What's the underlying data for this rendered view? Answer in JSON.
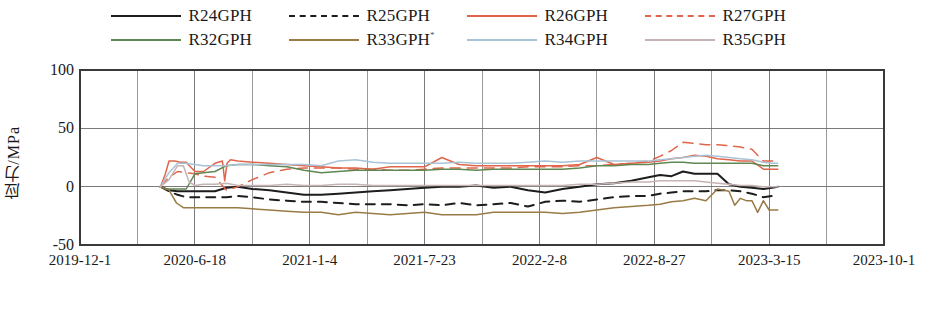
{
  "axes": {
    "ylabel": "应力/MPa",
    "xlabel": "日期",
    "yticks": [
      "100",
      "50",
      "0",
      "-50"
    ],
    "xticks": [
      "2019-12-1",
      "2020-6-18",
      "2021-1-4",
      "2021-7-23",
      "2022-2-8",
      "2022-8-27",
      "2023-3-15",
      "2023-10-1"
    ]
  },
  "legend": {
    "rows": [
      [
        {
          "label": "R24GPH",
          "color": "#1d1d1d",
          "dash": false,
          "star": ""
        },
        {
          "label": "R25GPH",
          "color": "#1d1d1d",
          "dash": true,
          "star": ""
        },
        {
          "label": "R26GPH",
          "color": "#e1654a",
          "dash": false,
          "star": ""
        },
        {
          "label": "R27GPH",
          "color": "#e1654a",
          "dash": true,
          "star": ""
        }
      ],
      [
        {
          "label": "R32GPH",
          "color": "#5f8752",
          "dash": false,
          "star": ""
        },
        {
          "label": "R33GPH",
          "color": "#9a7b46",
          "dash": false,
          "star": "*"
        },
        {
          "label": "R34GPH",
          "color": "#a9c3d6",
          "dash": false,
          "star": ""
        },
        {
          "label": "R35GPH",
          "color": "#c6b4b4",
          "dash": false,
          "star": ""
        }
      ]
    ]
  },
  "chart_data": {
    "type": "line",
    "title": "",
    "xlabel": "日期",
    "ylabel": "应力/MPa",
    "ylim": [
      -50,
      100
    ],
    "grid": true,
    "legend_position": "top",
    "x_tick_labels": [
      "2019-12-1",
      "2020-6-18",
      "2021-1-4",
      "2021-7-23",
      "2022-2-8",
      "2022-8-27",
      "2023-3-15",
      "2023-10-1"
    ],
    "x_tick_positions": [
      0,
      200,
      400,
      600,
      800,
      1000,
      1200,
      1400
    ],
    "x_units": "days since 2019-12-1",
    "x_data_range": [
      140,
      1215
    ],
    "series": [
      {
        "name": "R24GPH",
        "color": "#1d1d1d",
        "dash": "solid",
        "x": [
          140,
          155,
          170,
          185,
          200,
          215,
          235,
          255,
          275,
          300,
          330,
          360,
          390,
          420,
          450,
          480,
          510,
          540,
          570,
          600,
          630,
          660,
          690,
          720,
          750,
          780,
          810,
          840,
          870,
          900,
          930,
          960,
          990,
          1010,
          1030,
          1050,
          1070,
          1090,
          1110,
          1130,
          1150,
          1170,
          1190,
          1205,
          1215
        ],
        "y": [
          0,
          -3,
          -4,
          -4,
          -4,
          -4,
          -4,
          -1,
          0,
          -2,
          -3,
          -5,
          -7,
          -7,
          -6,
          -5,
          -4,
          -3,
          -2,
          -1,
          0,
          0,
          1,
          -1,
          0,
          -3,
          -5,
          -2,
          0,
          2,
          3,
          5,
          8,
          10,
          9,
          13,
          11,
          11,
          11,
          2,
          0,
          -1,
          -2,
          -1,
          0
        ]
      },
      {
        "name": "R25GPH",
        "color": "#1d1d1d",
        "dash": "dashed",
        "x": [
          140,
          155,
          170,
          185,
          200,
          215,
          235,
          255,
          275,
          300,
          330,
          360,
          390,
          420,
          450,
          480,
          510,
          540,
          570,
          600,
          630,
          660,
          690,
          720,
          750,
          780,
          810,
          840,
          870,
          900,
          930,
          960,
          990,
          1010,
          1030,
          1050,
          1070,
          1090,
          1110,
          1130,
          1150,
          1170,
          1190,
          1205,
          1215
        ],
        "y": [
          0,
          -4,
          -7,
          -9,
          -9,
          -9,
          -9,
          -9,
          -8,
          -9,
          -11,
          -12,
          -13,
          -13,
          -14,
          -15,
          -15,
          -15,
          -16,
          -15,
          -16,
          -14,
          -16,
          -15,
          -14,
          -17,
          -13,
          -12,
          -13,
          -11,
          -9,
          -8,
          -8,
          -6,
          -5,
          -4,
          -4,
          -4,
          -3,
          -3,
          -4,
          -6,
          -9,
          -8,
          -8
        ]
      },
      {
        "name": "R26GPH",
        "color": "#e1654a",
        "dash": "solid",
        "x": [
          140,
          148,
          155,
          165,
          175,
          185,
          200,
          215,
          235,
          248,
          252,
          256,
          262,
          275,
          300,
          330,
          360,
          390,
          420,
          450,
          480,
          510,
          540,
          570,
          600,
          630,
          660,
          690,
          720,
          750,
          780,
          810,
          840,
          870,
          900,
          930,
          960,
          990,
          1010,
          1030,
          1050,
          1070,
          1090,
          1110,
          1130,
          1150,
          1170,
          1190,
          1205,
          1215
        ],
        "y": [
          0,
          10,
          22,
          22,
          21,
          21,
          13,
          13,
          20,
          22,
          5,
          20,
          23,
          22,
          21,
          20,
          19,
          18,
          17,
          16,
          16,
          15,
          17,
          17,
          17,
          25,
          19,
          18,
          18,
          18,
          18,
          18,
          18,
          19,
          25,
          19,
          20,
          21,
          22,
          24,
          25,
          27,
          26,
          24,
          23,
          22,
          22,
          15,
          15,
          15
        ]
      },
      {
        "name": "R27GPH",
        "color": "#e1654a",
        "dash": "dashed",
        "x": [
          140,
          155,
          170,
          185,
          200,
          215,
          235,
          255,
          275,
          300,
          330,
          360,
          390,
          420,
          450,
          480,
          510,
          540,
          570,
          600,
          630,
          660,
          690,
          720,
          750,
          780,
          810,
          840,
          870,
          900,
          930,
          960,
          990,
          1010,
          1030,
          1050,
          1070,
          1090,
          1110,
          1130,
          1150,
          1170,
          1190,
          1205,
          1215
        ],
        "y": [
          0,
          8,
          13,
          12,
          11,
          9,
          8,
          -3,
          0,
          6,
          12,
          15,
          16,
          16,
          16,
          15,
          15,
          14,
          14,
          15,
          16,
          16,
          16,
          16,
          16,
          17,
          17,
          17,
          18,
          18,
          19,
          20,
          22,
          26,
          31,
          38,
          37,
          36,
          36,
          35,
          34,
          32,
          22,
          22,
          22
        ]
      },
      {
        "name": "R32GPH",
        "color": "#5f8752",
        "dash": "solid",
        "x": [
          140,
          150,
          160,
          170,
          185,
          200,
          215,
          235,
          255,
          275,
          300,
          330,
          360,
          390,
          420,
          450,
          480,
          510,
          540,
          570,
          600,
          630,
          660,
          690,
          720,
          750,
          780,
          810,
          840,
          870,
          900,
          930,
          960,
          990,
          1010,
          1030,
          1050,
          1070,
          1090,
          1110,
          1130,
          1150,
          1170,
          1190,
          1205,
          1215
        ],
        "y": [
          0,
          -2,
          -2,
          -2,
          -2,
          11,
          12,
          13,
          18,
          19,
          19,
          18,
          17,
          14,
          12,
          13,
          14,
          14,
          14,
          14,
          14,
          15,
          15,
          14,
          15,
          15,
          15,
          15,
          15,
          16,
          18,
          18,
          19,
          19,
          20,
          21,
          21,
          20,
          20,
          20,
          20,
          20,
          20,
          18,
          18,
          18
        ]
      },
      {
        "name": "R33GPH",
        "color": "#9a7b46",
        "dash": "solid",
        "x": [
          140,
          155,
          168,
          180,
          195,
          215,
          235,
          255,
          275,
          300,
          330,
          360,
          390,
          420,
          450,
          480,
          510,
          540,
          570,
          600,
          630,
          660,
          690,
          720,
          750,
          780,
          810,
          840,
          870,
          900,
          930,
          960,
          990,
          1010,
          1030,
          1050,
          1070,
          1090,
          1110,
          1130,
          1140,
          1150,
          1160,
          1170,
          1180,
          1190,
          1200,
          1215
        ],
        "y": [
          0,
          -3,
          -14,
          -18,
          -18,
          -18,
          -18,
          -18,
          -18,
          -19,
          -20,
          -21,
          -22,
          -22,
          -24,
          -22,
          -23,
          -24,
          -23,
          -22,
          -24,
          -24,
          -24,
          -22,
          -22,
          -22,
          -22,
          -23,
          -22,
          -20,
          -18,
          -17,
          -16,
          -15,
          -13,
          -12,
          -10,
          -12,
          -2,
          -4,
          -16,
          -10,
          -12,
          -12,
          -22,
          -12,
          -20,
          -20
        ]
      },
      {
        "name": "R34GPH",
        "color": "#a9c3d6",
        "dash": "solid",
        "x": [
          140,
          155,
          170,
          185,
          200,
          215,
          235,
          255,
          275,
          300,
          330,
          360,
          390,
          420,
          450,
          480,
          510,
          540,
          570,
          600,
          630,
          660,
          690,
          720,
          750,
          780,
          810,
          840,
          870,
          900,
          930,
          960,
          990,
          1010,
          1030,
          1050,
          1070,
          1090,
          1110,
          1130,
          1150,
          1170,
          1190,
          1205,
          1215
        ],
        "y": [
          0,
          12,
          20,
          20,
          19,
          18,
          18,
          18,
          19,
          19,
          19,
          19,
          19,
          18,
          22,
          23,
          21,
          20,
          20,
          20,
          20,
          21,
          20,
          20,
          20,
          21,
          22,
          21,
          22,
          22,
          22,
          22,
          22,
          23,
          24,
          25,
          26,
          27,
          26,
          25,
          24,
          23,
          21,
          20,
          20
        ]
      },
      {
        "name": "R35GPH",
        "color": "#c6b4b4",
        "dash": "solid",
        "x": [
          140,
          155,
          170,
          180,
          190,
          200,
          215,
          235,
          255,
          275,
          300,
          330,
          360,
          390,
          420,
          450,
          480,
          510,
          540,
          570,
          600,
          630,
          660,
          690,
          720,
          750,
          780,
          810,
          840,
          870,
          900,
          930,
          960,
          990,
          1010,
          1030,
          1050,
          1070,
          1090,
          1110,
          1130,
          1150,
          1170,
          1190,
          1205,
          1215
        ],
        "y": [
          0,
          6,
          18,
          18,
          4,
          1,
          2,
          2,
          3,
          1,
          1,
          1,
          2,
          1,
          1,
          2,
          2,
          1,
          1,
          1,
          1,
          1,
          1,
          1,
          1,
          1,
          1,
          1,
          1,
          2,
          2,
          3,
          4,
          4,
          5,
          5,
          5,
          5,
          4,
          3,
          2,
          1,
          1,
          0,
          0,
          0
        ]
      }
    ]
  }
}
